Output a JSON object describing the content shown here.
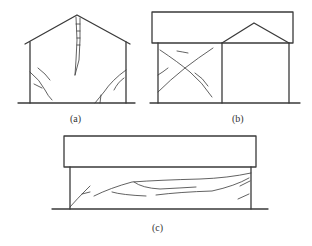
{
  "figure": {
    "type": "building crack pattern illustrations",
    "panels": [
      {
        "id": "a",
        "label": "(a)",
        "description": "Gable-roof building with vertical crack at gable apex and diagonal cracks at lower wall corners"
      },
      {
        "id": "b",
        "label": "(b)",
        "description": "Two-part building: flat-roof block on left with X-shaped cracks, adjacent gable-roof block on right"
      },
      {
        "id": "c",
        "label": "(c)",
        "description": "Long flat-roof building with horizontal cracks along wall and diagonal cracks near ends"
      }
    ]
  },
  "colors": {
    "line": "#3a3a3a",
    "background": "#ffffff"
  }
}
